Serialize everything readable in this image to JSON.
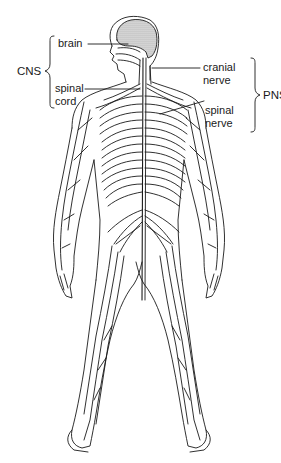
{
  "diagram": {
    "colors": {
      "line": "#1a1a1a",
      "brain_fill": "#bdbdbd",
      "background": "#ffffff"
    },
    "groups": {
      "cns": {
        "label": "CNS",
        "members": [
          "brain",
          "spinal cord"
        ]
      },
      "pns": {
        "label": "PNS",
        "members": [
          "cranial nerve",
          "spinal nerve"
        ]
      }
    },
    "labels": {
      "brain": "brain",
      "spinal_cord_1": "spinal",
      "spinal_cord_2": "cord",
      "cranial_nerve_1": "cranial",
      "cranial_nerve_2": "nerve",
      "spinal_nerve_1": "spinal",
      "spinal_nerve_2": "nerve"
    }
  }
}
